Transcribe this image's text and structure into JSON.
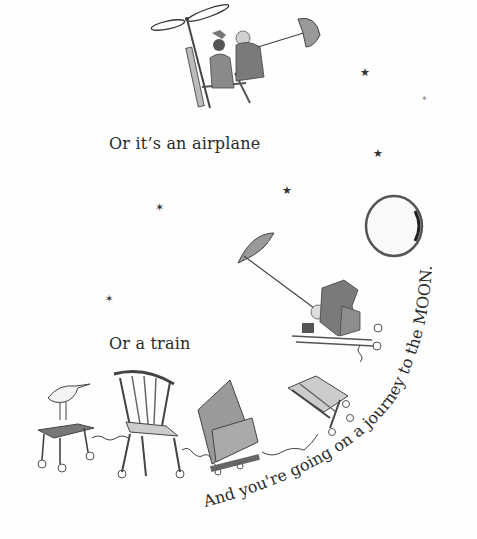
{
  "page": {
    "captions": {
      "airplane": "Or it’s an airplane",
      "train": "Or a train"
    },
    "curved_text": "And you're going on a journey to the MOON.",
    "illustrations": [
      {
        "name": "helicopter-chair-with-children",
        "description": "Two children riding a propeller chair holding an umbrella"
      },
      {
        "name": "moon",
        "description": "Full moon circle"
      },
      {
        "name": "sled-with-children-and-umbrella",
        "description": "Children flying on a sled pulled by an umbrella"
      },
      {
        "name": "chair-train",
        "description": "Stool with bird, wooden chair, armchair and tilted chair linked by springs"
      }
    ],
    "stars": [
      {
        "x": 362,
        "y": 63
      },
      {
        "x": 422,
        "y": 97
      },
      {
        "x": 375,
        "y": 150
      },
      {
        "x": 285,
        "y": 187
      },
      {
        "x": 157,
        "y": 204
      },
      {
        "x": 107,
        "y": 296
      }
    ],
    "colors": {
      "ink": "#2a2a2a",
      "wash": "#8c8c8c",
      "light_wash": "#b5b5b5"
    }
  }
}
